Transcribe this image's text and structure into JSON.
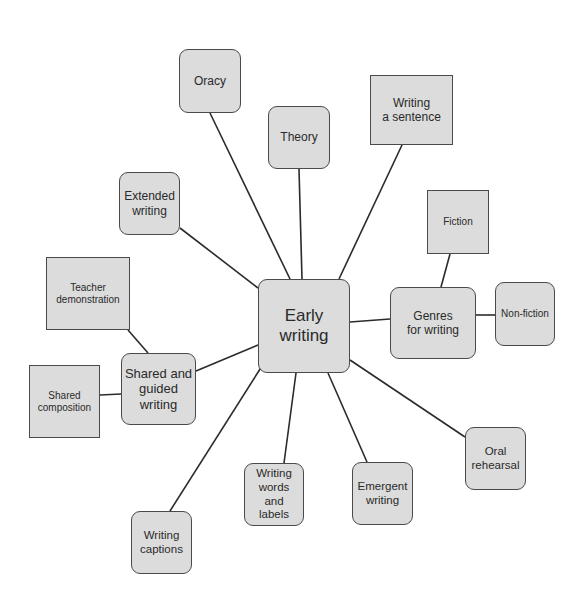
{
  "diagram": {
    "type": "mind-map",
    "center": {
      "id": "early",
      "label": "Early\nwriting",
      "x": 258,
      "y": 279,
      "w": 92,
      "h": 94,
      "shape": "rounded",
      "font": 17
    },
    "nodes": [
      {
        "id": "oracy",
        "label": "Oracy",
        "x": 179,
        "y": 49,
        "w": 62,
        "h": 64,
        "shape": "rounded",
        "font": 12
      },
      {
        "id": "theory",
        "label": "Theory",
        "x": 268,
        "y": 106,
        "w": 62,
        "h": 63,
        "shape": "rounded",
        "font": 12
      },
      {
        "id": "sentence",
        "label": "Writing\na sentence",
        "x": 370,
        "y": 75,
        "w": 83,
        "h": 70,
        "shape": "square",
        "font": 12
      },
      {
        "id": "extended",
        "label": "Extended\nwriting",
        "x": 119,
        "y": 172,
        "w": 61,
        "h": 63,
        "shape": "rounded",
        "font": 12
      },
      {
        "id": "teacher",
        "label": "Teacher\ndemonstration",
        "x": 46,
        "y": 257,
        "w": 84,
        "h": 73,
        "shape": "square",
        "font": 10
      },
      {
        "id": "shared",
        "label": "Shared and\nguided\nwriting",
        "x": 121,
        "y": 353,
        "w": 75,
        "h": 72,
        "shape": "rounded",
        "font": 13
      },
      {
        "id": "composition",
        "label": "Shared\ncomposition",
        "x": 29,
        "y": 365,
        "w": 71,
        "h": 73,
        "shape": "square",
        "font": 10
      },
      {
        "id": "genres",
        "label": "Genres\nfor writing",
        "x": 390,
        "y": 287,
        "w": 86,
        "h": 72,
        "shape": "rounded",
        "font": 12
      },
      {
        "id": "fiction",
        "label": "Fiction",
        "x": 427,
        "y": 190,
        "w": 62,
        "h": 64,
        "shape": "square",
        "font": 10
      },
      {
        "id": "nonfiction",
        "label": "Non-fiction",
        "x": 495,
        "y": 282,
        "w": 60,
        "h": 64,
        "shape": "rounded",
        "font": 10
      },
      {
        "id": "oral",
        "label": "Oral\nrehearsal",
        "x": 465,
        "y": 427,
        "w": 61,
        "h": 63,
        "shape": "rounded",
        "font": 11.5
      },
      {
        "id": "emergent",
        "label": "Emergent\nwriting",
        "x": 352,
        "y": 462,
        "w": 61,
        "h": 63,
        "shape": "rounded",
        "font": 11.5
      },
      {
        "id": "words",
        "label": "Writing\nwords\nand\nlabels",
        "x": 244,
        "y": 463,
        "w": 60,
        "h": 63,
        "shape": "rounded",
        "font": 11.5
      },
      {
        "id": "captions",
        "label": "Writing\ncaptions",
        "x": 131,
        "y": 511,
        "w": 61,
        "h": 63,
        "shape": "rounded",
        "font": 11.5
      }
    ],
    "edges": [
      {
        "from": "early",
        "to": "oracy",
        "x1": 290,
        "y1": 279,
        "x2": 210,
        "y2": 113
      },
      {
        "from": "early",
        "to": "theory",
        "x1": 302,
        "y1": 279,
        "x2": 299,
        "y2": 169
      },
      {
        "from": "early",
        "to": "sentence",
        "x1": 339,
        "y1": 279,
        "x2": 402,
        "y2": 145
      },
      {
        "from": "early",
        "to": "extended",
        "x1": 258,
        "y1": 288,
        "x2": 180,
        "y2": 228
      },
      {
        "from": "early",
        "to": "shared",
        "x1": 258,
        "y1": 345,
        "x2": 196,
        "y2": 371
      },
      {
        "from": "early",
        "to": "genres",
        "x1": 350,
        "y1": 322,
        "x2": 390,
        "y2": 319
      },
      {
        "from": "early",
        "to": "captions",
        "x1": 262,
        "y1": 366,
        "x2": 170,
        "y2": 511
      },
      {
        "from": "early",
        "to": "words",
        "x1": 296,
        "y1": 373,
        "x2": 284,
        "y2": 463
      },
      {
        "from": "early",
        "to": "emergent",
        "x1": 328,
        "y1": 373,
        "x2": 367,
        "y2": 462
      },
      {
        "from": "early",
        "to": "oral",
        "x1": 350,
        "y1": 360,
        "x2": 465,
        "y2": 437
      },
      {
        "from": "shared",
        "to": "teacher",
        "x1": 148,
        "y1": 353,
        "x2": 128,
        "y2": 330
      },
      {
        "from": "shared",
        "to": "composition",
        "x1": 121,
        "y1": 394,
        "x2": 100,
        "y2": 395
      },
      {
        "from": "genres",
        "to": "fiction",
        "x1": 441,
        "y1": 287,
        "x2": 450,
        "y2": 254
      },
      {
        "from": "genres",
        "to": "nonfiction",
        "x1": 476,
        "y1": 315,
        "x2": 495,
        "y2": 315
      }
    ]
  }
}
